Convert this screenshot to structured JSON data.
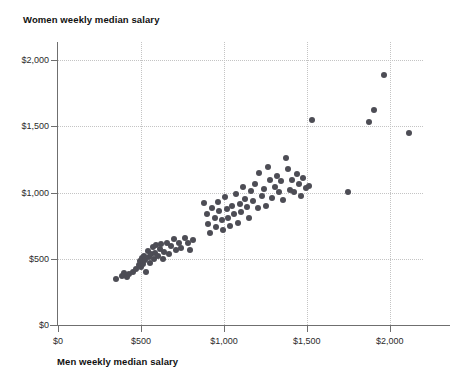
{
  "chart_data": {
    "type": "scatter",
    "title": "",
    "xlabel": "Men weekly median salary",
    "ylabel": "Women weekly median salary",
    "xlim": [
      0,
      2200
    ],
    "ylim": [
      0,
      2100
    ],
    "xticks": [
      0,
      500,
      1000,
      1500,
      2000
    ],
    "yticks": [
      0,
      500,
      1000,
      1500,
      2000
    ],
    "xticklabels": [
      "$0",
      "$500",
      "$1,000",
      "$1,500",
      "$2,000"
    ],
    "yticklabels": [
      "$0",
      "$500",
      "$1,000",
      "$1,500",
      "$2,000"
    ],
    "grid": true,
    "grid_style": "dotted",
    "legend": false,
    "marker_color": "#4d4d55",
    "marker_size": 6,
    "series": [
      {
        "name": "Occupations",
        "points": [
          [
            352,
            348
          ],
          [
            383,
            372
          ],
          [
            399,
            395
          ],
          [
            414,
            360
          ],
          [
            428,
            383
          ],
          [
            452,
            404
          ],
          [
            470,
            420
          ],
          [
            487,
            452
          ],
          [
            492,
            487
          ],
          [
            498,
            440
          ],
          [
            505,
            506
          ],
          [
            512,
            463
          ],
          [
            520,
            520
          ],
          [
            525,
            492
          ],
          [
            533,
            398
          ],
          [
            540,
            556
          ],
          [
            548,
            512
          ],
          [
            553,
            468
          ],
          [
            561,
            534
          ],
          [
            570,
            590
          ],
          [
            578,
            498
          ],
          [
            585,
            545
          ],
          [
            592,
            606
          ],
          [
            601,
            520
          ],
          [
            612,
            576
          ],
          [
            623,
            614
          ],
          [
            632,
            498
          ],
          [
            640,
            555
          ],
          [
            655,
            621
          ],
          [
            668,
            534
          ],
          [
            683,
            598
          ],
          [
            699,
            648
          ],
          [
            712,
            563
          ],
          [
            727,
            620
          ],
          [
            744,
            585
          ],
          [
            763,
            655
          ],
          [
            782,
            617
          ],
          [
            796,
            570
          ],
          [
            812,
            643
          ],
          [
            880,
            918
          ],
          [
            897,
            840
          ],
          [
            903,
            760
          ],
          [
            917,
            697
          ],
          [
            931,
            882
          ],
          [
            944,
            806
          ],
          [
            953,
            742
          ],
          [
            965,
            930
          ],
          [
            972,
            862
          ],
          [
            988,
            790
          ],
          [
            996,
            714
          ],
          [
            1009,
            965
          ],
          [
            1018,
            878
          ],
          [
            1027,
            812
          ],
          [
            1038,
            748
          ],
          [
            1046,
            900
          ],
          [
            1059,
            836
          ],
          [
            1071,
            988
          ],
          [
            1082,
            772
          ],
          [
            1095,
            916
          ],
          [
            1104,
            851
          ],
          [
            1118,
            1042
          ],
          [
            1128,
            950
          ],
          [
            1141,
            889
          ],
          [
            1153,
            806
          ],
          [
            1166,
            1010
          ],
          [
            1178,
            935
          ],
          [
            1190,
            1068
          ],
          [
            1203,
            886
          ],
          [
            1212,
            1148
          ],
          [
            1228,
            975
          ],
          [
            1240,
            1030
          ],
          [
            1253,
            898
          ],
          [
            1268,
            1196
          ],
          [
            1279,
            1092
          ],
          [
            1291,
            963
          ],
          [
            1305,
            1044
          ],
          [
            1318,
            1128
          ],
          [
            1332,
            1006
          ],
          [
            1345,
            1087
          ],
          [
            1358,
            942
          ],
          [
            1372,
            1264
          ],
          [
            1385,
            1175
          ],
          [
            1398,
            1021
          ],
          [
            1412,
            1093
          ],
          [
            1425,
            1006
          ],
          [
            1438,
            1140
          ],
          [
            1452,
            1066
          ],
          [
            1466,
            975
          ],
          [
            1479,
            1110
          ],
          [
            1492,
            1038
          ],
          [
            1510,
            1052
          ],
          [
            1530,
            1548
          ],
          [
            1748,
            1004
          ],
          [
            1876,
            1531
          ],
          [
            1905,
            1622
          ],
          [
            1962,
            1890
          ],
          [
            2115,
            1454
          ]
        ]
      }
    ]
  }
}
